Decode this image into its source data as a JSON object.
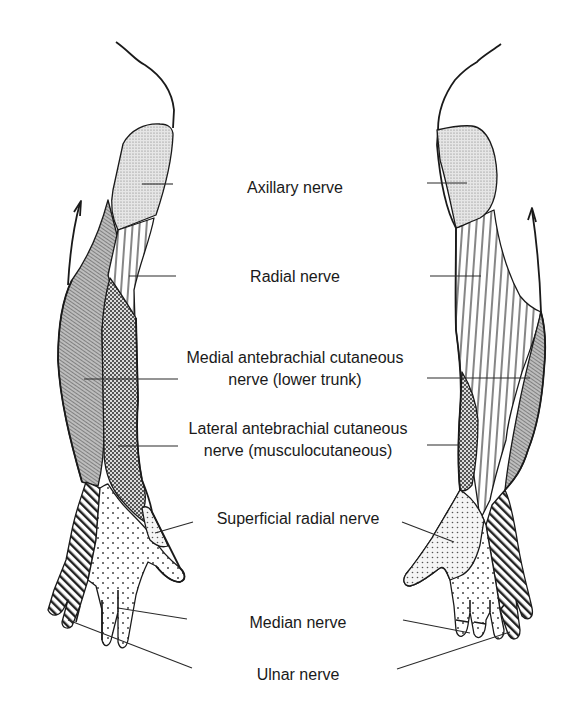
{
  "figure": {
    "ink_color": "#1a1a1a",
    "background": "#ffffff"
  },
  "legend_patterns": {
    "axillary": "fine-stipple",
    "radial": "vertical-lines",
    "medial_antebrachial": "diagonal-hatch-dense",
    "lateral_antebrachial": "checker-dots",
    "superficial_radial": "medium-dots",
    "median": "sparse-dots",
    "ulnar": "diagonal-stripes-bold"
  },
  "labels": [
    {
      "id": "axillary",
      "text": "Axillary nerve",
      "x": 295,
      "y": 177
    },
    {
      "id": "radial",
      "text": "Radial nerve",
      "x": 295,
      "y": 266
    },
    {
      "id": "medial_antebrachial_1",
      "text": "Medial antebrachial cutaneous",
      "x": 295,
      "y": 347
    },
    {
      "id": "medial_antebrachial_2",
      "text": "nerve (lower trunk)",
      "x": 295,
      "y": 369
    },
    {
      "id": "lateral_antebrachial_1",
      "text": "Lateral antebrachial cutaneous",
      "x": 298,
      "y": 418
    },
    {
      "id": "lateral_antebrachial_2",
      "text": "nerve (musculocutaneous)",
      "x": 298,
      "y": 440
    },
    {
      "id": "superficial_radial",
      "text": "Superficial radial nerve",
      "x": 298,
      "y": 508
    },
    {
      "id": "median",
      "text": "Median nerve",
      "x": 298,
      "y": 612
    },
    {
      "id": "ulnar",
      "text": "Ulnar nerve",
      "x": 298,
      "y": 664
    }
  ],
  "leader_lines": {
    "axillary_left": [
      142,
      184,
      173,
      184
    ],
    "axillary_right": [
      427,
      183,
      467,
      183
    ],
    "radial_left": [
      129,
      276,
      176,
      276
    ],
    "radial_right": [
      430,
      276,
      481,
      276
    ],
    "medial_left": [
      84,
      379,
      178,
      379
    ],
    "medial_right": [
      427,
      378,
      530,
      378
    ],
    "lateral_left": [
      118,
      446,
      178,
      446
    ],
    "lateral_right": [
      427,
      445,
      462,
      445
    ],
    "superficial_left": [
      155,
      533,
      193,
      522
    ],
    "superficial_right": [
      402,
      522,
      454,
      542
    ],
    "median_left": [
      118,
      608,
      187,
      619
    ],
    "median_right": [
      403,
      620,
      470,
      633
    ],
    "ulnar_left": [
      68,
      620,
      192,
      668
    ],
    "ulnar_right": [
      397,
      669,
      510,
      632
    ]
  }
}
